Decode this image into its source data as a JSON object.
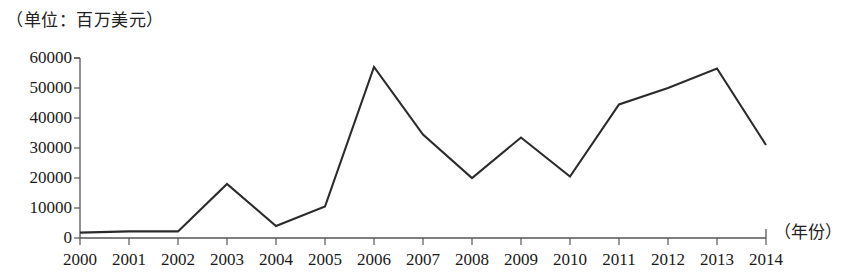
{
  "chart_data": {
    "type": "line",
    "title": "（单位：百万美元）",
    "subtitle": "",
    "xlabel": "（年份）",
    "ylabel": "",
    "unit_note": "（单位：百万美元）",
    "categories": [
      "2000",
      "2001",
      "2002",
      "2003",
      "2004",
      "2005",
      "2006",
      "2007",
      "2008",
      "2009",
      "2010",
      "2011",
      "2012",
      "2013",
      "2014"
    ],
    "values": [
      1800,
      2200,
      2200,
      18000,
      4000,
      10500,
      57000,
      34500,
      20000,
      33500,
      20500,
      44500,
      50000,
      56500,
      31000
    ],
    "series": [
      {
        "name": "",
        "values": [
          1800,
          2200,
          2200,
          18000,
          4000,
          10500,
          57000,
          34500,
          20000,
          33500,
          20500,
          44500,
          50000,
          56500,
          31000
        ]
      }
    ],
    "ylim": [
      0,
      60000
    ],
    "ytick_labels": [
      "0",
      "10000",
      "20000",
      "30000",
      "40000",
      "50000",
      "60000"
    ],
    "ytick_values": [
      0,
      10000,
      20000,
      30000,
      40000,
      50000,
      60000
    ],
    "xtick_labels": [
      "2000",
      "2001",
      "2002",
      "2003",
      "2004",
      "2005",
      "2006",
      "2007",
      "2008",
      "2009",
      "2010",
      "2011",
      "2012",
      "2013",
      "2014"
    ],
    "grid": false,
    "legend": null,
    "legend_position": "none",
    "line_color": "#2b2b2b",
    "axis_color": "#555555",
    "background_color": "#ffffff"
  },
  "axes": {
    "y_title": "（单位：百万美元）",
    "x_title": "（年份）"
  }
}
